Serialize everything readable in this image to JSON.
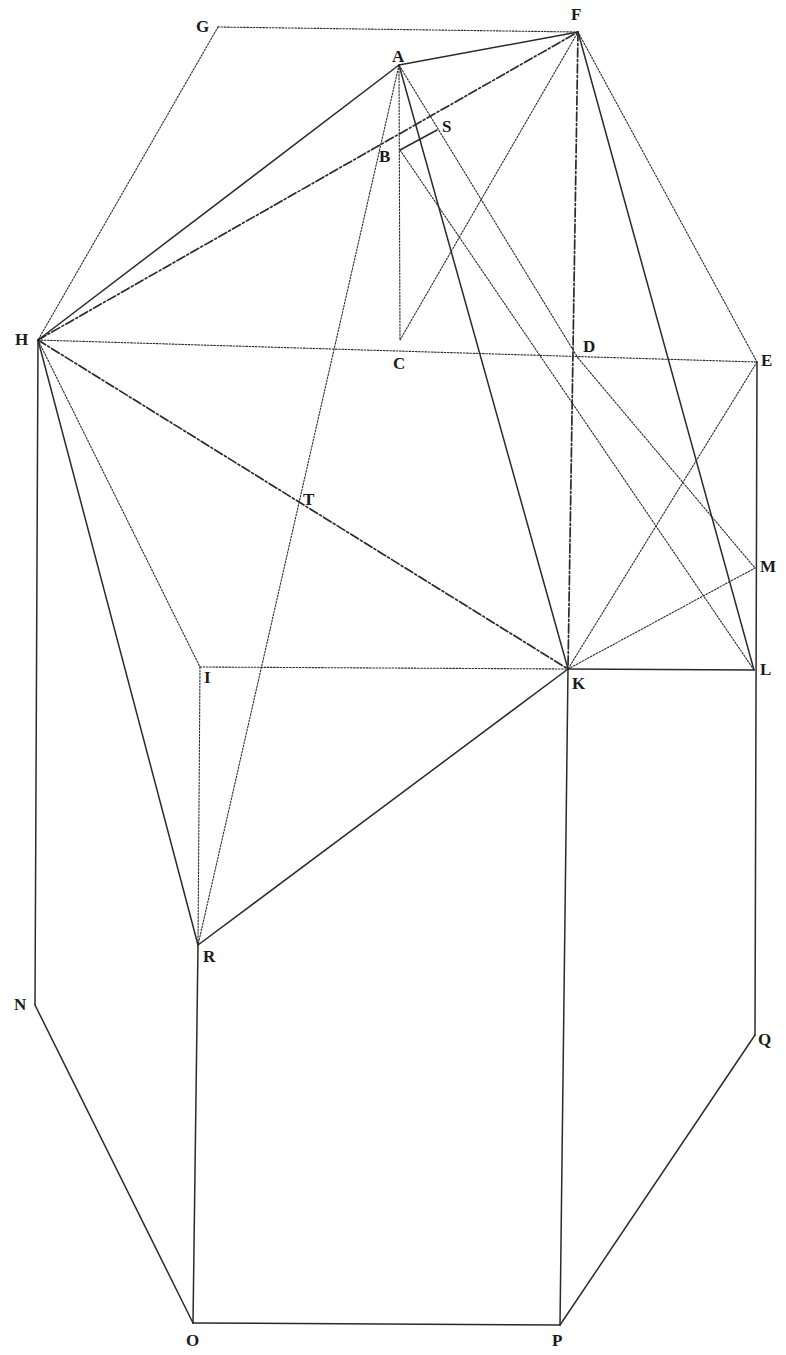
{
  "diagram": {
    "type": "geometric-construction",
    "points": {
      "A": {
        "label": "A"
      },
      "B": {
        "label": "B"
      },
      "C": {
        "label": "C"
      },
      "D": {
        "label": "D"
      },
      "E": {
        "label": "E"
      },
      "F": {
        "label": "F"
      },
      "G": {
        "label": "G"
      },
      "H": {
        "label": "H"
      },
      "I": {
        "label": "I"
      },
      "K": {
        "label": "K"
      },
      "L": {
        "label": "L"
      },
      "M": {
        "label": "M"
      },
      "N": {
        "label": "N"
      },
      "O": {
        "label": "O"
      },
      "P": {
        "label": "P"
      },
      "Q": {
        "label": "Q"
      },
      "R": {
        "label": "R"
      },
      "S": {
        "label": "S"
      },
      "T": {
        "label": "T"
      }
    },
    "segments": [
      {
        "from": "G",
        "to": "F",
        "style": "dotted"
      },
      {
        "from": "G",
        "to": "H",
        "style": "dotted"
      },
      {
        "from": "A",
        "to": "F",
        "style": "solid"
      },
      {
        "from": "H",
        "to": "A",
        "style": "solid"
      },
      {
        "from": "H",
        "to": "F",
        "style": "dashdot"
      },
      {
        "from": "B",
        "to": "S",
        "style": "solid"
      },
      {
        "from": "A",
        "to": "C",
        "style": "dotted"
      },
      {
        "from": "A",
        "to": "R",
        "style": "dotted"
      },
      {
        "from": "A",
        "to": "K",
        "style": "solid"
      },
      {
        "from": "A",
        "to": "D",
        "style": "dotted"
      },
      {
        "from": "B",
        "to": "L",
        "style": "dotted"
      },
      {
        "from": "C",
        "to": "F",
        "style": "dotted"
      },
      {
        "from": "F",
        "to": "K",
        "style": "dashdot"
      },
      {
        "from": "F",
        "to": "L",
        "style": "solid"
      },
      {
        "from": "F",
        "to": "E",
        "style": "dotted"
      },
      {
        "from": "H",
        "to": "E",
        "style": "dotted"
      },
      {
        "from": "H",
        "to": "K",
        "style": "dashdot"
      },
      {
        "from": "H",
        "to": "I",
        "style": "dotted"
      },
      {
        "from": "H",
        "to": "R",
        "style": "solid"
      },
      {
        "from": "H",
        "to": "N",
        "style": "solid"
      },
      {
        "from": "D",
        "to": "M",
        "style": "dotted"
      },
      {
        "from": "E",
        "to": "K",
        "style": "dotted"
      },
      {
        "from": "E",
        "to": "Q",
        "style": "solid"
      },
      {
        "from": "K",
        "to": "M",
        "style": "dotted"
      },
      {
        "from": "I",
        "to": "K",
        "style": "dotted"
      },
      {
        "from": "K",
        "to": "L",
        "style": "solid"
      },
      {
        "from": "I",
        "to": "R",
        "style": "dotted"
      },
      {
        "from": "R",
        "to": "K",
        "style": "solid"
      },
      {
        "from": "R",
        "to": "O",
        "style": "solid"
      },
      {
        "from": "K",
        "to": "P",
        "style": "solid"
      },
      {
        "from": "N",
        "to": "O",
        "style": "solid"
      },
      {
        "from": "O",
        "to": "P",
        "style": "solid"
      },
      {
        "from": "P",
        "to": "Q",
        "style": "solid"
      }
    ]
  }
}
